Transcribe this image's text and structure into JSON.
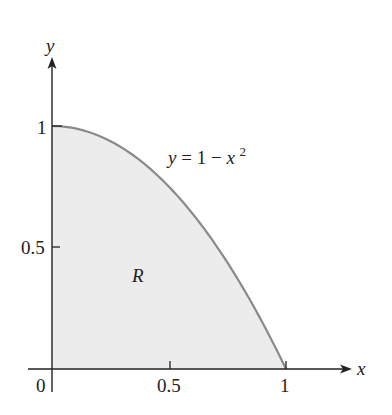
{
  "chart_data": {
    "type": "area",
    "title": "",
    "xlabel": "x",
    "ylabel": "y",
    "curve": {
      "label": "y = 1 − x²",
      "equation_parts": {
        "lhs": "y",
        "eq": "= 1 −",
        "var": "x",
        "exp": "2"
      },
      "function": "1 - x^2",
      "domain": [
        0,
        1
      ],
      "points": [
        [
          0,
          1
        ],
        [
          0.25,
          0.9375
        ],
        [
          0.5,
          0.75
        ],
        [
          0.75,
          0.4375
        ],
        [
          1,
          0
        ]
      ]
    },
    "region": {
      "label": "R",
      "description": "Area under y = 1 − x² from x = 0 to x = 1, above the x-axis"
    },
    "x_ticks": [
      {
        "value": 0,
        "label": "0"
      },
      {
        "value": 0.5,
        "label": "0.5"
      },
      {
        "value": 1,
        "label": "1"
      }
    ],
    "y_ticks": [
      {
        "value": 0.5,
        "label": "0.5"
      },
      {
        "value": 1,
        "label": "1"
      }
    ],
    "xlim": [
      0,
      1.2
    ],
    "ylim": [
      0,
      1.25
    ],
    "grid": false,
    "legend": "none",
    "colors": {
      "fill": "#ececec",
      "curve": "#8a8a8a",
      "axis": "#222222"
    }
  }
}
